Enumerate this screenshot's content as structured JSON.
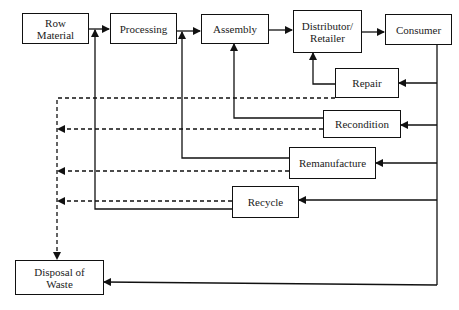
{
  "diagram": {
    "type": "flowchart",
    "title": "",
    "nodes": [
      {
        "id": "row_material",
        "label": "Row\nMaterial"
      },
      {
        "id": "processing",
        "label": "Processing"
      },
      {
        "id": "assembly",
        "label": "Assembly"
      },
      {
        "id": "distributor",
        "label": "Distributor/\nRetailer"
      },
      {
        "id": "consumer",
        "label": "Consumer"
      },
      {
        "id": "repair",
        "label": "Repair"
      },
      {
        "id": "recondition",
        "label": "Recondition"
      },
      {
        "id": "remanufacture",
        "label": "Remanufacture"
      },
      {
        "id": "recycle",
        "label": "Recycle"
      },
      {
        "id": "disposal",
        "label": "Disposal of\nWaste"
      }
    ],
    "edges": [
      {
        "from": "row_material",
        "to": "processing",
        "style": "solid"
      },
      {
        "from": "processing",
        "to": "assembly",
        "style": "solid"
      },
      {
        "from": "assembly",
        "to": "distributor",
        "style": "solid"
      },
      {
        "from": "distributor",
        "to": "consumer",
        "style": "solid"
      },
      {
        "from": "consumer",
        "to": "repair",
        "style": "solid"
      },
      {
        "from": "consumer",
        "to": "recondition",
        "style": "solid"
      },
      {
        "from": "consumer",
        "to": "remanufacture",
        "style": "solid"
      },
      {
        "from": "consumer",
        "to": "recycle",
        "style": "solid"
      },
      {
        "from": "consumer",
        "to": "disposal",
        "style": "solid"
      },
      {
        "from": "repair",
        "to": "distributor",
        "style": "solid"
      },
      {
        "from": "recondition",
        "to": "assembly",
        "style": "solid"
      },
      {
        "from": "remanufacture",
        "to": "processing",
        "style": "solid"
      },
      {
        "from": "recycle",
        "to": "processing",
        "style": "solid"
      },
      {
        "from": "repair",
        "to": "disposal",
        "style": "dashed"
      },
      {
        "from": "recondition",
        "to": "disposal",
        "style": "dashed"
      },
      {
        "from": "remanufacture",
        "to": "disposal",
        "style": "dashed"
      },
      {
        "from": "recycle",
        "to": "disposal",
        "style": "dashed"
      }
    ]
  }
}
